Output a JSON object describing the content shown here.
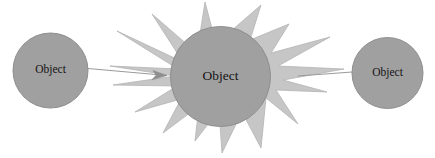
{
  "diagram": {
    "type": "object-interaction-diagram",
    "canvas": {
      "width": 435,
      "height": 158,
      "background": "#ffffff"
    },
    "colors": {
      "circle_fill": "#a0a0a0",
      "circle_stroke": "#8e8e8e",
      "burst_fill": "#c6c6c6",
      "burst_stroke": "#b4b4b4",
      "connector_stroke": "#9a9a9a",
      "label_color": "#141414"
    },
    "nodes": [
      {
        "id": "left-object",
        "label": "Object",
        "shape": "circle",
        "cx": 50.5,
        "cy": 70.5,
        "r": 37.5,
        "label_size": "small"
      },
      {
        "id": "center-object",
        "label": "Object",
        "shape": "circle",
        "cx": 220.5,
        "cy": 76.5,
        "r": 50,
        "label_size": "large",
        "has_burst": true
      },
      {
        "id": "right-object",
        "label": "Object",
        "shape": "circle",
        "cx": 387.5,
        "cy": 73,
        "r": 35.5,
        "label_size": "small"
      }
    ],
    "burst": {
      "id": "center-burst",
      "name": "collision-starburst",
      "spike_count": 12,
      "points": "261,5 250,40 289,24 271,53 330,37 278,66 344,69 283,80 327,92 276,90 298,124 266,98 261,148 242,112 222,153 219,110 195,141 199,106 163,133 181,99 135,112 177,86 113,85 175,76 110,66 178,69 117,31 183,62 152,14 197,53 205,2 216,44"
    },
    "connectors": [
      {
        "id": "left-connector",
        "name": "left-to-center-arrow",
        "x1": 88,
        "y1": 68.5,
        "x2": 167,
        "y2": 75.5,
        "arrowhead": true,
        "arrow_points": "167,75.5 153,70.5 156,75.2 152,79.8"
      },
      {
        "id": "right-connector",
        "name": "center-to-right-line",
        "x1": 298,
        "y1": 76,
        "x2": 352,
        "y2": 72,
        "arrowhead": false
      }
    ]
  }
}
